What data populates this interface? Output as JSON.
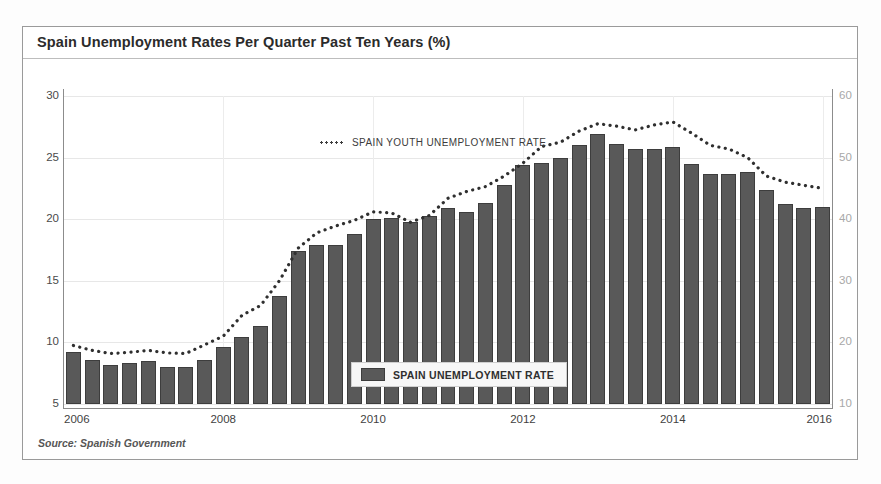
{
  "chart_title": "Spain Unemployment Rates Per Quarter Past Ten Years (%)",
  "source_note": "Source: Spanish Government",
  "legend": {
    "youth_label": "SPAIN YOUTH UNEMPLOYMENT RATE",
    "bar_label": "SPAIN UNEMPLOYMENT RATE"
  },
  "colors": {
    "bar_fill": "#595959",
    "bar_stroke": "#3d3d3d",
    "dotted_line": "#2f2f2f",
    "grid": "#e7e7e7",
    "axis": "#8c8c8c",
    "right_axis_text": "#a8a8a8",
    "left_axis_text": "#4a4a4a"
  },
  "chart_data": {
    "type": "bar",
    "title": "Spain Unemployment Rates Per Quarter Past Ten Years (%)",
    "xlabel": "",
    "ylabel": "",
    "grid": true,
    "legend_position": "inside",
    "x_tick_labels": [
      "2006",
      "2008",
      "2010",
      "2012",
      "2014",
      "2016"
    ],
    "x_tick_positions": [
      0,
      8,
      16,
      24,
      32,
      40
    ],
    "categories": [
      "2006 Q1",
      "2006 Q2",
      "2006 Q3",
      "2006 Q4",
      "2007 Q1",
      "2007 Q2",
      "2007 Q3",
      "2007 Q4",
      "2008 Q1",
      "2008 Q2",
      "2008 Q3",
      "2008 Q4",
      "2009 Q1",
      "2009 Q2",
      "2009 Q3",
      "2009 Q4",
      "2010 Q1",
      "2010 Q2",
      "2010 Q3",
      "2010 Q4",
      "2011 Q1",
      "2011 Q2",
      "2011 Q3",
      "2011 Q4",
      "2012 Q1",
      "2012 Q2",
      "2012 Q3",
      "2012 Q4",
      "2013 Q1",
      "2013 Q2",
      "2013 Q3",
      "2013 Q4",
      "2014 Q1",
      "2014 Q2",
      "2014 Q3",
      "2014 Q4",
      "2015 Q1",
      "2015 Q2",
      "2015 Q3",
      "2015 Q4",
      "2016 Q1"
    ],
    "series": [
      {
        "name": "SPAIN UNEMPLOYMENT RATE",
        "type": "bar",
        "axis": "left",
        "ylim": [
          5,
          30
        ],
        "yticks": [
          5,
          10,
          15,
          20,
          25,
          30
        ],
        "values": [
          9.2,
          8.6,
          8.2,
          8.3,
          8.5,
          8.0,
          8.0,
          8.6,
          9.6,
          10.4,
          11.3,
          13.8,
          17.4,
          17.9,
          17.9,
          18.8,
          20.0,
          20.1,
          19.8,
          20.3,
          20.9,
          20.6,
          21.3,
          22.8,
          24.4,
          24.6,
          25.0,
          26.0,
          26.9,
          26.1,
          25.7,
          25.7,
          25.9,
          24.5,
          23.7,
          23.7,
          23.8,
          22.4,
          21.2,
          20.9,
          21.0
        ]
      },
      {
        "name": "SPAIN YOUTH UNEMPLOYMENT RATE",
        "type": "line",
        "style": "dotted",
        "axis": "right",
        "ylim": [
          10,
          60
        ],
        "yticks": [
          10,
          20,
          30,
          40,
          50,
          60
        ],
        "values": [
          19.5,
          18.7,
          18.2,
          18.4,
          18.7,
          18.3,
          18.2,
          19.6,
          21.0,
          24.4,
          26.0,
          30.0,
          35.3,
          37.8,
          38.9,
          39.8,
          41.2,
          41.0,
          39.5,
          40.6,
          43.4,
          44.5,
          45.3,
          47.0,
          49.1,
          51.8,
          52.5,
          54.3,
          55.5,
          55.1,
          54.5,
          55.3,
          55.8,
          54.0,
          52.0,
          51.4,
          50.0,
          47.0,
          46.0,
          45.5,
          45.0
        ]
      }
    ]
  }
}
